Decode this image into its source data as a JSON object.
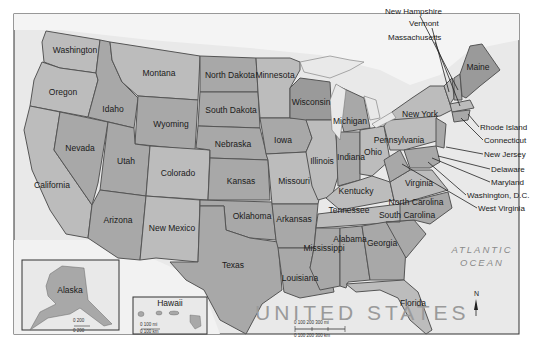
{
  "map": {
    "title": "UNITED STATES",
    "ocean_label_line1": "ATLANTIC",
    "ocean_label_line2": "OCEAN",
    "north_label": "N",
    "colors": {
      "land_light": "#bcbcbc",
      "land_mid": "#a8a8a8",
      "land_dark": "#9a9a9a",
      "water": "#e8e8e8",
      "border": "#555555"
    },
    "states": [
      {
        "name": "Washington"
      },
      {
        "name": "Oregon"
      },
      {
        "name": "California"
      },
      {
        "name": "Nevada"
      },
      {
        "name": "Idaho"
      },
      {
        "name": "Montana"
      },
      {
        "name": "Wyoming"
      },
      {
        "name": "Utah"
      },
      {
        "name": "Arizona"
      },
      {
        "name": "Colorado"
      },
      {
        "name": "New Mexico"
      },
      {
        "name": "North Dakota"
      },
      {
        "name": "South Dakota"
      },
      {
        "name": "Nebraska"
      },
      {
        "name": "Kansas"
      },
      {
        "name": "Oklahoma"
      },
      {
        "name": "Texas"
      },
      {
        "name": "Minnesota"
      },
      {
        "name": "Iowa"
      },
      {
        "name": "Missouri"
      },
      {
        "name": "Arkansas"
      },
      {
        "name": "Louisiana"
      },
      {
        "name": "Wisconsin"
      },
      {
        "name": "Illinois"
      },
      {
        "name": "Michigan"
      },
      {
        "name": "Indiana"
      },
      {
        "name": "Ohio"
      },
      {
        "name": "Kentucky"
      },
      {
        "name": "Tennessee"
      },
      {
        "name": "Mississippi"
      },
      {
        "name": "Alabama"
      },
      {
        "name": "Georgia"
      },
      {
        "name": "Florida"
      },
      {
        "name": "South Carolina"
      },
      {
        "name": "North Carolina"
      },
      {
        "name": "Virginia"
      },
      {
        "name": "Pennsylvania"
      },
      {
        "name": "New York"
      },
      {
        "name": "Maine"
      }
    ],
    "callout_states": [
      {
        "name": "New Hampshire"
      },
      {
        "name": "Vermont"
      },
      {
        "name": "Massachusetts"
      },
      {
        "name": "Rhode Island"
      },
      {
        "name": "Connecticut"
      },
      {
        "name": "New Jersey"
      },
      {
        "name": "Delaware"
      },
      {
        "name": "Maryland"
      },
      {
        "name": "Washington, D.C."
      },
      {
        "name": "West Virginia"
      }
    ],
    "insets": {
      "alaska": {
        "label": "Alaska",
        "scale_top": "0     200",
        "scale_bottom": "0  200"
      },
      "hawaii": {
        "label": "Hawaii",
        "scale_top": "0     100 mi",
        "scale_bottom": "0     100 km"
      }
    },
    "scale_bar": {
      "miles": "0    100    200    300 mi",
      "km": "0  100  200  300 km"
    }
  }
}
